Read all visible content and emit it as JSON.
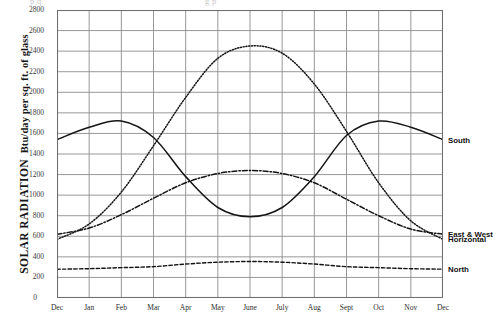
{
  "figure": {
    "bleed_text_left": "p  q",
    "bleed_text_right": "g  p"
  },
  "axis": {
    "y_title_main": "SOLAR RADIATION",
    "y_title_sub": "Btu/day per sq. ft. of glass",
    "y_ticks": [
      "2800",
      "2600",
      "2400",
      "2200",
      "2000",
      "1800",
      "1600",
      "1400",
      "1200",
      "1000",
      "800",
      "600",
      "400",
      "200",
      "0"
    ],
    "x_ticks": [
      "Dec",
      "Jan",
      "Feb",
      "Mar",
      "Apr",
      "May",
      "June",
      "July",
      "Aug",
      "Sept",
      "Oct",
      "Nov",
      "Dec"
    ]
  },
  "series_labels": {
    "south": "South",
    "horizontal": "Horizontal",
    "east_west": "East & West",
    "north": "North"
  },
  "colors": {
    "ink": "#141414",
    "grid": "#8c8c8c",
    "frame": "#6f6f6f"
  },
  "chart_data": {
    "type": "line",
    "title": "",
    "xlabel": "",
    "ylabel": "SOLAR RADIATION Btu/day per sq. ft. of glass",
    "x": [
      "Dec",
      "Jan",
      "Feb",
      "Mar",
      "Apr",
      "May",
      "June",
      "July",
      "Aug",
      "Sept",
      "Oct",
      "Nov",
      "Dec"
    ],
    "ylim": [
      0,
      2800
    ],
    "ytick_step": 200,
    "grid": true,
    "legend": "right-edge inline labels",
    "series": [
      {
        "name": "South",
        "style": "solid",
        "values": [
          1540,
          1660,
          1720,
          1560,
          1180,
          880,
          790,
          880,
          1180,
          1580,
          1720,
          1660,
          1540
        ]
      },
      {
        "name": "Horizontal",
        "style": "dotted",
        "values": [
          570,
          720,
          1030,
          1480,
          1950,
          2330,
          2450,
          2380,
          2080,
          1620,
          1120,
          750,
          570
        ]
      },
      {
        "name": "East & West",
        "style": "dash-dot",
        "values": [
          620,
          680,
          810,
          970,
          1120,
          1210,
          1240,
          1210,
          1120,
          960,
          800,
          670,
          620
        ]
      },
      {
        "name": "North",
        "style": "dashed",
        "values": [
          280,
          285,
          295,
          305,
          330,
          348,
          355,
          348,
          330,
          305,
          295,
          285,
          280
        ]
      }
    ]
  }
}
